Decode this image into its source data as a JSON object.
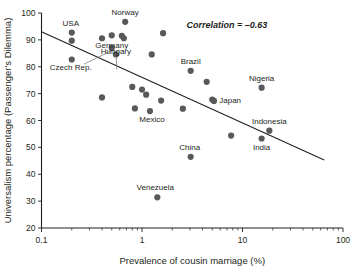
{
  "chart_data": {
    "type": "scatter",
    "title": "",
    "xlabel": "Prevalence of cousin marriage (%)",
    "ylabel": "Universalism percentage (Passenger's Dilemma)",
    "xscale": "log",
    "yscale": "linear",
    "xlim": [
      0.1,
      100
    ],
    "ylim": [
      20,
      100
    ],
    "grid": false,
    "legend": false,
    "xticks": [
      "0.1",
      "1",
      "10",
      "100"
    ],
    "yticks": [
      "20",
      "30",
      "40",
      "50",
      "60",
      "70",
      "80",
      "90",
      "100"
    ],
    "annotations": [
      {
        "name": "correlation",
        "text": "Correlation = –0.63",
        "x": 7.0,
        "y": 94.5
      }
    ],
    "trendline": {
      "x_start": 0.1,
      "y_start": 93.0,
      "x_end": 65.0,
      "y_end": 45.3
    },
    "points": [
      {
        "label": "USA",
        "x": 0.2,
        "y": 92.7,
        "label_dx": -1,
        "label_dy": -7,
        "anchor": "middle"
      },
      {
        "label": "",
        "x": 0.2,
        "y": 89.7,
        "label_dx": 0,
        "label_dy": 0,
        "anchor": "middle"
      },
      {
        "label": "Czech Rep.",
        "x": 0.2,
        "y": 82.7,
        "label_dx": -1,
        "label_dy": 11,
        "anchor": "middle"
      },
      {
        "label": "",
        "x": 0.4,
        "y": 90.6,
        "label_dx": 0,
        "label_dy": 0,
        "anchor": "middle"
      },
      {
        "label": "",
        "x": 0.4,
        "y": 68.6,
        "label_dx": 0,
        "label_dy": 0,
        "anchor": "middle"
      },
      {
        "label": "Germany",
        "x": 0.5,
        "y": 87.0,
        "label_dx": 0,
        "label_dy": 0,
        "anchor": "middle"
      },
      {
        "label": "",
        "x": 0.5,
        "y": 91.7,
        "label_dx": 0,
        "label_dy": 0,
        "anchor": "middle"
      },
      {
        "label": "Hungary",
        "x": 0.55,
        "y": 84.6,
        "label_dx": 0,
        "label_dy": 0,
        "anchor": "middle"
      },
      {
        "label": "",
        "x": 0.63,
        "y": 91.5,
        "label_dx": 0,
        "label_dy": 0,
        "anchor": "middle"
      },
      {
        "label": "",
        "x": 0.66,
        "y": 90.6,
        "label_dx": 0,
        "label_dy": 0,
        "anchor": "middle"
      },
      {
        "label": "Norway",
        "x": 0.68,
        "y": 96.7,
        "label_dx": 0,
        "label_dy": -7,
        "anchor": "middle"
      },
      {
        "label": "",
        "x": 0.8,
        "y": 72.5,
        "label_dx": 0,
        "label_dy": 0,
        "anchor": "middle"
      },
      {
        "label": "",
        "x": 0.85,
        "y": 64.5,
        "label_dx": 0,
        "label_dy": 0,
        "anchor": "middle"
      },
      {
        "label": "",
        "x": 1.0,
        "y": 71.5,
        "label_dx": 0,
        "label_dy": 0,
        "anchor": "middle"
      },
      {
        "label": "",
        "x": 1.1,
        "y": 69.6,
        "label_dx": 0,
        "label_dy": 0,
        "anchor": "middle"
      },
      {
        "label": "Mexico",
        "x": 1.2,
        "y": 63.5,
        "label_dx": 2,
        "label_dy": 11,
        "anchor": "middle"
      },
      {
        "label": "",
        "x": 1.25,
        "y": 84.6,
        "label_dx": 0,
        "label_dy": 0,
        "anchor": "middle"
      },
      {
        "label": "Venezuela",
        "x": 1.42,
        "y": 31.4,
        "label_dx": -2,
        "label_dy": -7,
        "anchor": "middle"
      },
      {
        "label": "",
        "x": 1.55,
        "y": 67.4,
        "label_dx": 0,
        "label_dy": 0,
        "anchor": "middle"
      },
      {
        "label": "",
        "x": 1.62,
        "y": 92.5,
        "label_dx": 0,
        "label_dy": 0,
        "anchor": "middle"
      },
      {
        "label": "",
        "x": 2.55,
        "y": 64.4,
        "label_dx": 0,
        "label_dy": 0,
        "anchor": "middle"
      },
      {
        "label": "Brazil",
        "x": 3.05,
        "y": 78.5,
        "label_dx": 0,
        "label_dy": -7,
        "anchor": "middle"
      },
      {
        "label": "China",
        "x": 3.05,
        "y": 46.5,
        "label_dx": -1,
        "label_dy": -7,
        "anchor": "middle"
      },
      {
        "label": "",
        "x": 4.4,
        "y": 74.4,
        "label_dx": 0,
        "label_dy": 0,
        "anchor": "middle"
      },
      {
        "label": "Japan",
        "x": 5.0,
        "y": 67.8,
        "label_dx": 7,
        "label_dy": 3,
        "anchor": "start"
      },
      {
        "label": "",
        "x": 5.2,
        "y": 67.3,
        "label_dx": 0,
        "label_dy": 0,
        "anchor": "middle"
      },
      {
        "label": "",
        "x": 7.7,
        "y": 54.4,
        "label_dx": 0,
        "label_dy": 0,
        "anchor": "middle"
      },
      {
        "label": "Nigeria",
        "x": 15.5,
        "y": 72.2,
        "label_dx": 0,
        "label_dy": -7,
        "anchor": "middle"
      },
      {
        "label": "India",
        "x": 15.5,
        "y": 53.3,
        "label_dx": 0,
        "label_dy": 11,
        "anchor": "middle"
      },
      {
        "label": "Indonesia",
        "x": 18.5,
        "y": 56.2,
        "label_dx": 0,
        "label_dy": -7,
        "anchor": "middle"
      }
    ],
    "leader_lines": [
      {
        "name": "germany-leader",
        "x1": 0.265,
        "y1": 81.0,
        "x2": 0.5,
        "y2": 86.0
      },
      {
        "name": "hungary-leader",
        "x1": 0.56,
        "y1": 79.0,
        "x2": 0.555,
        "y2": 83.5
      }
    ]
  }
}
